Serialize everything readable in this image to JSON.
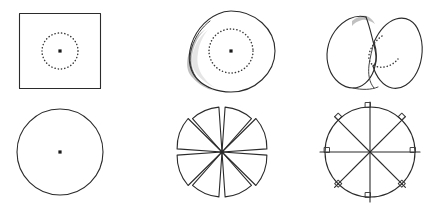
{
  "figure": {
    "title": "",
    "background_color": "#ffffff",
    "stroke_color": "#2b2b2b",
    "shade_color": "#b8b8b8",
    "dot_color": "#1a1a1a",
    "width": 444,
    "height": 203,
    "rows": 2,
    "columns": 3
  },
  "panels": [
    {
      "id": "panel-square-flat",
      "position": "top-left",
      "shape_name": "square-with-dotted-circle",
      "description": "Flat square sheet with a dotted circle inscribed and a marked center point",
      "has_center_dot": true,
      "has_dotted_curve": true,
      "has_shading": false,
      "geometry": {
        "square_left": 19,
        "square_top": 13,
        "square_right": 101,
        "square_bottom": 89,
        "center_x": 60,
        "center_y": 51,
        "dotted_radius": 18
      }
    },
    {
      "id": "panel-dome",
      "position": "top-center",
      "shape_name": "dome-with-dotted-circle",
      "description": "Shallow dome or buckled disk seen obliquely, shaded crescent along the lower-left rim, dotted circle and center point",
      "has_center_dot": true,
      "has_dotted_curve": true,
      "has_shading": true,
      "geometry": {
        "center_x": 231,
        "center_y": 52,
        "outer_radius_x": 44,
        "outer_radius_y": 41,
        "dotted_radius": 22
      }
    },
    {
      "id": "panel-saddle",
      "position": "top-right",
      "shape_name": "buckled-saddle-disk",
      "description": "Strongly buckled two-lobed saddle surface with a dotted curve tracing the inner fold",
      "has_center_dot": false,
      "has_dotted_curve": true,
      "has_shading": true,
      "geometry": {
        "center_x": 372,
        "center_y": 52
      }
    },
    {
      "id": "panel-circle-flat",
      "position": "bottom-left",
      "shape_name": "circle-with-center-dot",
      "description": "Flat circular disk outline with a marked center point",
      "has_center_dot": true,
      "has_dotted_curve": false,
      "has_shading": false,
      "geometry": {
        "center_x": 60,
        "center_y": 152,
        "radius": 43
      }
    },
    {
      "id": "panel-sectors-gapped",
      "position": "bottom-center",
      "shape_name": "disk-cut-into-eight-sectors-with-gaps",
      "description": "Circular disk cut radially into eight sectors separated by wedge-shaped gaps, like an opened pinwheel",
      "sector_count": 8,
      "has_center_dot": false,
      "has_dotted_curve": false,
      "has_shading": false,
      "geometry": {
        "center_x": 222,
        "center_y": 152,
        "radius": 45,
        "gap_degrees": 7
      }
    },
    {
      "id": "panel-sectors-overlapped",
      "position": "bottom-right",
      "shape_name": "disk-with-eight-radial-cuts-overlapped",
      "description": "Circular disk with eight radial cuts whose edges overlap, producing small tabs at the rim",
      "sector_count": 8,
      "has_center_dot": false,
      "has_dotted_curve": false,
      "has_shading": false,
      "geometry": {
        "center_x": 370,
        "center_y": 152,
        "radius": 45,
        "tab_size": 5
      }
    }
  ]
}
